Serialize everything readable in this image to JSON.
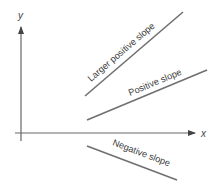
{
  "diagram": {
    "axes": {
      "x_label": "x",
      "y_label": "y"
    },
    "lines": [
      {
        "id": "larger-positive",
        "label": "Larger positive slope",
        "x1": 85,
        "y1": 96,
        "x2": 183,
        "y2": 12
      },
      {
        "id": "positive",
        "label": "Positive slope",
        "x1": 87,
        "y1": 120,
        "x2": 207,
        "y2": 70
      },
      {
        "id": "negative",
        "label": "Negative slope",
        "x1": 87,
        "y1": 146,
        "x2": 177,
        "y2": 180
      }
    ],
    "colors": {
      "line": "#6e6e6e",
      "axis": "#555555",
      "text": "#3a3a3a",
      "background": "#ffffff"
    }
  }
}
